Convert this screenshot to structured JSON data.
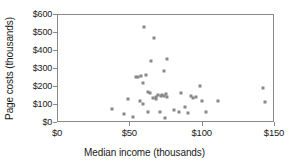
{
  "chart_data": {
    "type": "scatter",
    "title": "",
    "xlabel": "Median income (thousands)",
    "ylabel": "Page costs (thousands)",
    "xlim": [
      0,
      150
    ],
    "ylim": [
      0,
      600
    ],
    "xticks": [
      0,
      50,
      100,
      150
    ],
    "yticks": [
      0,
      100,
      200,
      300,
      400,
      500,
      600
    ],
    "xticklabels": [
      "$0",
      "$50",
      "$100",
      "$150"
    ],
    "yticklabels": [
      "$0",
      "$100",
      "$200",
      "$300",
      "$400",
      "$500",
      "$600"
    ],
    "grid": false,
    "legend": null,
    "marker_color": "#888888",
    "marker_shape": "square",
    "points": [
      {
        "x": 37.5,
        "y": 77
      },
      {
        "x": 45.5,
        "y": 51
      },
      {
        "x": 48.5,
        "y": 136
      },
      {
        "x": 52.0,
        "y": 33
      },
      {
        "x": 54.0,
        "y": 255
      },
      {
        "x": 55.5,
        "y": 257
      },
      {
        "x": 56.5,
        "y": 122
      },
      {
        "x": 57.5,
        "y": 263
      },
      {
        "x": 58.5,
        "y": 225
      },
      {
        "x": 59.0,
        "y": 103
      },
      {
        "x": 59.5,
        "y": 533
      },
      {
        "x": 60.5,
        "y": 264
      },
      {
        "x": 62.0,
        "y": 62
      },
      {
        "x": 62.5,
        "y": 172
      },
      {
        "x": 63.5,
        "y": 168
      },
      {
        "x": 64.0,
        "y": 345
      },
      {
        "x": 65.5,
        "y": 137
      },
      {
        "x": 66.5,
        "y": 471
      },
      {
        "x": 67.5,
        "y": 147
      },
      {
        "x": 68.0,
        "y": 133
      },
      {
        "x": 69.0,
        "y": 158
      },
      {
        "x": 70.5,
        "y": 60
      },
      {
        "x": 71.5,
        "y": 148
      },
      {
        "x": 72.0,
        "y": 155
      },
      {
        "x": 73.0,
        "y": 152
      },
      {
        "x": 73.5,
        "y": 289
      },
      {
        "x": 74.0,
        "y": 30
      },
      {
        "x": 74.5,
        "y": 161
      },
      {
        "x": 75.0,
        "y": 357
      },
      {
        "x": 75.5,
        "y": 146
      },
      {
        "x": 80.5,
        "y": 74
      },
      {
        "x": 83.5,
        "y": 62
      },
      {
        "x": 85.0,
        "y": 169
      },
      {
        "x": 87.5,
        "y": 91
      },
      {
        "x": 90.0,
        "y": 58
      },
      {
        "x": 92.0,
        "y": 151
      },
      {
        "x": 93.5,
        "y": 141
      },
      {
        "x": 95.5,
        "y": 143
      },
      {
        "x": 98.0,
        "y": 205
      },
      {
        "x": 99.5,
        "y": 124
      },
      {
        "x": 102.0,
        "y": 59
      },
      {
        "x": 110.5,
        "y": 124
      },
      {
        "x": 142.0,
        "y": 193
      },
      {
        "x": 143.0,
        "y": 114
      }
    ]
  }
}
